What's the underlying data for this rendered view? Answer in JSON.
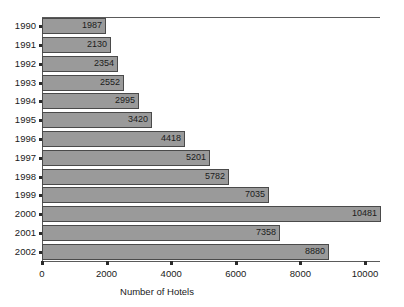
{
  "chart_data": {
    "type": "bar",
    "orientation": "horizontal",
    "title": "",
    "xlabel": "Number of Hotels",
    "ylabel": "",
    "categories": [
      "1990",
      "1991",
      "1992",
      "1993",
      "1994",
      "1995",
      "1996",
      "1997",
      "1998",
      "1999",
      "2000",
      "2001",
      "2002"
    ],
    "values": [
      1987,
      2130,
      2354,
      2552,
      2995,
      3420,
      4418,
      5201,
      5782,
      7035,
      10481,
      7358,
      8880
    ],
    "value_labels": [
      "1987",
      "2130",
      "2354",
      "2552",
      "2995",
      "3420",
      "4418",
      "5201",
      "5782",
      "7035",
      "10481",
      "7358",
      "8880"
    ],
    "xlim": [
      0,
      11000
    ],
    "xticks": [
      0,
      2000,
      4000,
      6000,
      8000,
      10000
    ],
    "xtick_labels": [
      "0",
      "2000",
      "4000",
      "6000",
      "8000",
      "10000"
    ],
    "grid": false,
    "legend": null,
    "bar_color": "#9a9a9a",
    "bar_border_color": "#4a4a4a",
    "axis_color": "#5a5a5a",
    "text_color": "#1a1a1a"
  }
}
